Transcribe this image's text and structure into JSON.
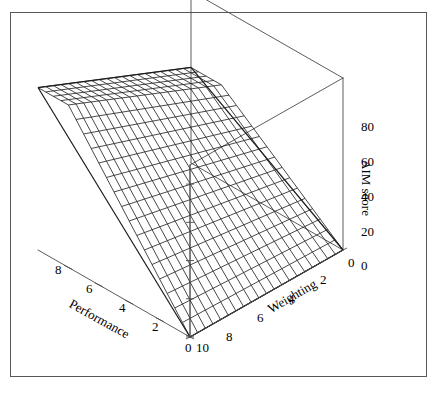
{
  "figure": {
    "kind": "3d-wireframe-surface-plot",
    "background": "#ffffff",
    "border_color": "#55595c",
    "mesh_color": "#1a1a1a",
    "axis_color": "#4a4a4a"
  },
  "chart_data": {
    "type": "surface",
    "title": "",
    "subtitle": "",
    "projection": "3d-wireframe-mesh",
    "grid": false,
    "legend": null,
    "xlabel": "Performance",
    "ylabel": "Weighting",
    "zlabel": "AIM score",
    "xlim": [
      0,
      10
    ],
    "ylim": [
      0,
      10
    ],
    "zlim": [
      0,
      90
    ],
    "x_ticklabels": [
      "8",
      "6",
      "4",
      "2",
      "0"
    ],
    "x_tickvalues": [
      8,
      6,
      4,
      2,
      0
    ],
    "y_ticklabels": [
      "0",
      "2",
      "4",
      "6",
      "8",
      "10"
    ],
    "y_tickvalues": [
      0,
      2,
      4,
      6,
      8,
      10
    ],
    "z_ticklabels": [
      "0",
      "20",
      "40",
      "60",
      "80"
    ],
    "z_tickvalues": [
      0,
      20,
      40,
      60,
      80
    ],
    "mesh_divisions": 20,
    "corner_values": {
      "performance_10_weighting_10": 85,
      "performance_10_weighting_0": 50,
      "performance_0_weighting_10": 0,
      "performance_0_weighting_0": 0
    },
    "x": [
      0,
      1,
      2,
      3,
      4,
      5,
      6,
      7,
      8,
      9,
      10
    ],
    "y": [
      0,
      1,
      2,
      3,
      4,
      5,
      6,
      7,
      8,
      9,
      10
    ],
    "z": [
      [
        0,
        5,
        10,
        15,
        20,
        25,
        30,
        35,
        40,
        45,
        50
      ],
      [
        0,
        5.5,
        11,
        16.5,
        22,
        27.5,
        33,
        38.5,
        44,
        49.5,
        55
      ],
      [
        0,
        6,
        12,
        18,
        24,
        30,
        36,
        42,
        48,
        54,
        60
      ],
      [
        0,
        6.5,
        13,
        19.5,
        26,
        32.5,
        39,
        45.5,
        52,
        58.5,
        65
      ],
      [
        0,
        7,
        14,
        21,
        28,
        35,
        42,
        49,
        56,
        63,
        70
      ],
      [
        0,
        7.5,
        15,
        22.5,
        30,
        37.5,
        45,
        52.5,
        60,
        67.5,
        75
      ],
      [
        0,
        8,
        16,
        24,
        32,
        40,
        48,
        56,
        64,
        72,
        80
      ],
      [
        0,
        8.5,
        17,
        25.5,
        34,
        42.5,
        51,
        59.5,
        68,
        76.5,
        85
      ],
      [
        0,
        8.5,
        17,
        25.5,
        34,
        42.5,
        51,
        59.5,
        68,
        76.5,
        85
      ],
      [
        0,
        8.5,
        17,
        25.5,
        34,
        42.5,
        51,
        59.5,
        68,
        76.5,
        85
      ],
      [
        0,
        8.5,
        17,
        25.5,
        34,
        42.5,
        51,
        59.5,
        68,
        76.5,
        85
      ]
    ]
  },
  "axes": {
    "z": {
      "name": "AIM score",
      "ticks": [
        {
          "label": "80"
        },
        {
          "label": "60"
        },
        {
          "label": "40"
        },
        {
          "label": "20"
        },
        {
          "label": "0"
        }
      ]
    },
    "x": {
      "name": "Performance",
      "ticks": [
        {
          "label": "8"
        },
        {
          "label": "6"
        },
        {
          "label": "4"
        },
        {
          "label": "2"
        },
        {
          "label": "0"
        }
      ]
    },
    "y": {
      "name": "Weighting",
      "ticks": [
        {
          "label": "0"
        },
        {
          "label": "2"
        },
        {
          "label": "4"
        },
        {
          "label": "6"
        },
        {
          "label": "8"
        },
        {
          "label": "10"
        }
      ]
    }
  }
}
